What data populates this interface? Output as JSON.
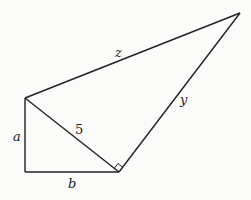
{
  "diagram": {
    "type": "geometry",
    "colors": {
      "stroke": "#222222",
      "background": "#fbfbfa"
    },
    "vertices": {
      "A": {
        "x": 25,
        "y": 98
      },
      "B": {
        "x": 25,
        "y": 172
      },
      "C": {
        "x": 119,
        "y": 172
      },
      "D": {
        "x": 240,
        "y": 13
      }
    },
    "segments": [
      {
        "from": "A",
        "to": "B",
        "label": "a"
      },
      {
        "from": "B",
        "to": "C",
        "label": "b"
      },
      {
        "from": "A",
        "to": "C",
        "label": "5"
      },
      {
        "from": "C",
        "to": "D",
        "label": "y"
      },
      {
        "from": "A",
        "to": "D",
        "label": "z"
      }
    ],
    "right_angle_marker": {
      "at": "C",
      "between": [
        "A",
        "D"
      ]
    },
    "labels": {
      "a": "a",
      "b": "b",
      "five": "5",
      "y": "y",
      "z": "z"
    }
  }
}
